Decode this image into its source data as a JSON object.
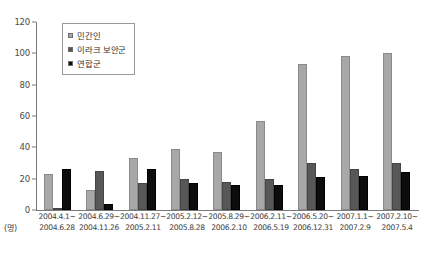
{
  "chart_data": {
    "type": "bar",
    "title": "",
    "xlabel": "",
    "ylabel": "",
    "unit_label": "(명)",
    "ylim": [
      0,
      120
    ],
    "yticks": [
      0,
      20,
      40,
      60,
      80,
      100,
      120
    ],
    "grid": false,
    "legend_position": "top-left",
    "categories": [
      "2004.4.1~\n2004.6.28",
      "2004.6.29~\n2004.11.26",
      "2004.11.27~\n2005.2.11",
      "2005.2.12~\n2005.8.28",
      "2005.8.29~\n2006.2.10",
      "2006.2.11~\n2006.5.19",
      "2006.5.20~\n2006.12.31",
      "2007.1.1~\n2007.2.9",
      "2007.2.10~\n2007.5.4"
    ],
    "categories_lines": [
      [
        "2004.4.1~",
        "2004.6.28"
      ],
      [
        "2004.6.29~",
        "2004.11.26"
      ],
      [
        "2004.11.27~",
        "2005.2.11"
      ],
      [
        "2005.2.12~",
        "2005.8.28"
      ],
      [
        "2005.8.29~",
        "2006.2.10"
      ],
      [
        "2006.2.11~",
        "2006.5.19"
      ],
      [
        "2006.5.20~",
        "2006.12.31"
      ],
      [
        "2007.1.1~",
        "2007.2.9"
      ],
      [
        "2007.2.10~",
        "2007.5.4"
      ]
    ],
    "series": [
      {
        "name": "민간인",
        "color": "#a8a8a8",
        "values": [
          23,
          13,
          33,
          39,
          37,
          57,
          93,
          98,
          100
        ]
      },
      {
        "name": "이라크 보안군",
        "color": "#585858",
        "values": [
          1,
          25,
          17,
          20,
          18,
          20,
          30,
          26,
          30
        ]
      },
      {
        "name": "연합군",
        "color": "#0d0d0d",
        "values": [
          26,
          4,
          26,
          17,
          16,
          16,
          21,
          22,
          24
        ]
      }
    ]
  },
  "legend": {
    "items": [
      {
        "label": "민간인"
      },
      {
        "label": "이라크 보안군"
      },
      {
        "label": "연합군"
      }
    ]
  }
}
